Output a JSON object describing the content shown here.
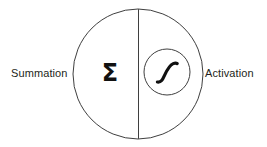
{
  "figure": {
    "kind": "neuron-node-diagram",
    "background_color": "#ffffff",
    "stroke_color": "#3f3f3f",
    "text_color": "#231f20",
    "glyph_color": "#111111"
  },
  "labels": {
    "left": "Summation",
    "right": "Activation"
  },
  "node": {
    "outer_circle": {
      "name": "neuron-body",
      "center_x": 138,
      "center_y": 74,
      "radius": 65,
      "fill": "none",
      "stroke": "#3f3f3f",
      "stroke_width": 1
    },
    "divider": {
      "name": "vertical-divider",
      "x": 138.5,
      "y_top": 9,
      "y_bottom": 139,
      "stroke": "#3f3f3f",
      "stroke_width": 1
    },
    "inner_circle": {
      "name": "activation-circle",
      "center_x": 167,
      "center_y": 72,
      "radius": 23,
      "fill": "none",
      "stroke": "#3f3f3f",
      "stroke_width": 1
    },
    "summation_symbol": {
      "name": "sigma-symbol",
      "glyph": "Σ",
      "center_x": 110,
      "center_y": 73,
      "font_size": 24,
      "font_weight": "bold",
      "color": "#111111"
    },
    "activation_symbol": {
      "name": "sigmoid-curve-icon",
      "description": "sigmoid S-curve",
      "center_x": 167,
      "center_y": 72,
      "stroke": "#111111",
      "stroke_width": 3.2
    }
  }
}
